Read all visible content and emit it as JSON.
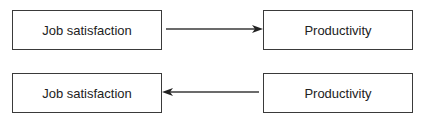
{
  "diagram": {
    "rows": [
      {
        "left_box": {
          "label": "Job satisfaction"
        },
        "right_box": {
          "label": "Productivity"
        },
        "arrow_direction": "left-to-right"
      },
      {
        "left_box": {
          "label": "Job satisfaction"
        },
        "right_box": {
          "label": "Productivity"
        },
        "arrow_direction": "right-to-left"
      }
    ],
    "colors": {
      "stroke": "#3a3a3a",
      "text": "#222222",
      "background": "#ffffff"
    }
  }
}
